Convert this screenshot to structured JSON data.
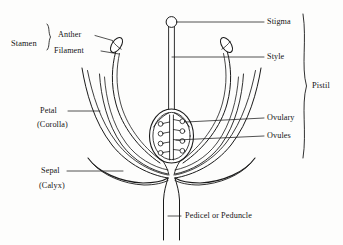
{
  "diagram": {
    "background_color": "#fdfdfc",
    "ink_color": "#1a1a1a",
    "labels": {
      "stamen": "Stamen",
      "anther": "Anther",
      "filament": "Filament",
      "petal": "Petal",
      "corolla": "(Corolla)",
      "sepal": "Sepal",
      "calyx": "(Calyx)",
      "stigma": "Stigma",
      "style": "Style",
      "ovulary": "Ovulary",
      "ovules": "Ovules",
      "pistil": "Pistil",
      "pedicel": "Pedicel or Peduncle"
    },
    "parts": {
      "ovule_count_per_side": 4,
      "ovule_sides": 2,
      "anther_count": 2,
      "petal_count": 4,
      "sepal_count": 2
    }
  }
}
